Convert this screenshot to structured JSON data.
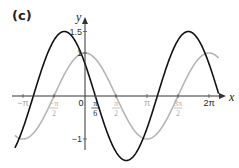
{
  "panel_label": "(c)",
  "chart_data": {
    "type": "line",
    "title": "",
    "xlabel": "x",
    "ylabel": "y",
    "xlim": [
      -3.5,
      7.0
    ],
    "ylim": [
      -1.6,
      1.7
    ],
    "grid": false,
    "x_ticks": [
      {
        "value": -3.14159,
        "label": "−π",
        "color": "#aaaaaa"
      },
      {
        "value": -1.5708,
        "label": "−π/2",
        "color": "#aaaaaa"
      },
      {
        "value": 0,
        "label": "0",
        "color": "#222222"
      },
      {
        "value": 0.5236,
        "label": "π/6",
        "color": "#222222"
      },
      {
        "value": 1.5708,
        "label": "π/2",
        "color": "#aaaaaa"
      },
      {
        "value": 3.14159,
        "label": "π",
        "color": "#aaaaaa"
      },
      {
        "value": 4.7124,
        "label": "3π/2",
        "color": "#aaaaaa"
      },
      {
        "value": 6.28318,
        "label": "2π",
        "color": "#222222"
      }
    ],
    "y_ticks": [
      {
        "value": 1.5,
        "label": "1.5"
      },
      {
        "value": 1,
        "label": "1"
      },
      {
        "value": -1,
        "label": "−1"
      }
    ],
    "series": [
      {
        "name": "y = 1.5cos(x + π/3)",
        "color": "#111111",
        "amplitude": 1.5,
        "phase_shift": 1.0472,
        "x_range": [
          -3.55,
          6.8
        ]
      },
      {
        "name": "y = cos x",
        "color": "#b5b5b5",
        "amplitude": 1.0,
        "phase_shift": 0,
        "x_range": [
          -3.55,
          6.8
        ]
      }
    ]
  }
}
